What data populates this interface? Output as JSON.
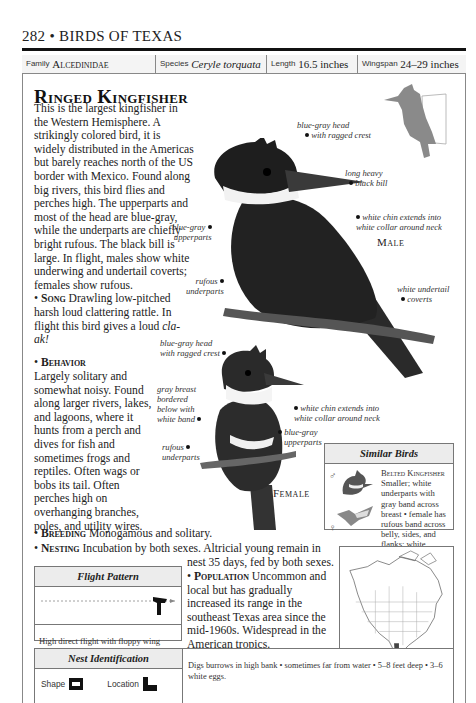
{
  "running_head": {
    "page_number": "282",
    "separator": "•",
    "book_title": "BIRDS OF TEXAS"
  },
  "info_bar": {
    "family": {
      "label": "Family",
      "value": "Alcedinidae"
    },
    "species": {
      "label": "Species",
      "value": "Ceryle torquata"
    },
    "length": {
      "label": "Length",
      "value": "16.5 inches"
    },
    "wingspan": {
      "label": "Wingspan",
      "value": "24–29 inches"
    }
  },
  "title": "Ringed Kingfisher",
  "description": "This is the largest kingfisher in the Western Hemisphere. A strikingly colored bird, it is widely distributed in the Americas but barely reaches north of the US border with Mexico. Found along big rivers, this bird flies and perches high. The upperparts and most of the head are blue-gray, while the underparts are chiefly bright rufous. The black bill is large. In flight, males show white underwing and undertail coverts; females show rufous.",
  "song": {
    "heading": "Song",
    "text": "Drawling low-pitched harsh loud clattering rattle. In flight this bird gives a loud",
    "call": "cla-ak!"
  },
  "behavior": {
    "heading": "Behavior",
    "text": "Largely solitary and somewhat noisy. Found along larger rivers, lakes, and lagoons, where it hunts from a perch and dives for fish and sometimes frogs and reptiles. Often wags or bobs its tail. Often perches high on overhanging branches, poles, and utility wires."
  },
  "breeding": {
    "heading": "Breeding",
    "text": "Monogamous and solitary."
  },
  "nesting": {
    "heading": "Nesting",
    "text_line1": "Incubation by both sexes. Altricial young remain in",
    "text_line2": "nest 35 days, fed by both sexes."
  },
  "population": {
    "heading": "Population",
    "text": "Uncommon and local but has gradually increased its range in the southeast Texas area since the mid-1960s. Widespread in the American tropics."
  },
  "male_illustration": {
    "label": "Male",
    "callouts": {
      "head": [
        "blue-gray head",
        "with ragged crest"
      ],
      "bill": [
        "long heavy",
        "black bill"
      ],
      "chin": [
        "white chin extends into",
        "white collar around neck"
      ],
      "upperparts": [
        "blue-gray",
        "upperparts"
      ],
      "underparts": [
        "rufous",
        "underparts"
      ],
      "undertail": [
        "white undertail",
        "coverts"
      ]
    }
  },
  "female_illustration": {
    "label": "Female",
    "callouts": {
      "head": [
        "blue-gray head",
        "with ragged crest"
      ],
      "breast": [
        "gray breast",
        "bordered",
        "below with",
        "white band"
      ],
      "chin": [
        "white chin extends into",
        "white collar around neck"
      ],
      "upperparts": [
        "blue-gray",
        "upperparts"
      ],
      "underparts": [
        "rufous",
        "underparts"
      ]
    }
  },
  "similar_birds": {
    "heading": "Similar Birds",
    "male_symbol": "♂",
    "female_symbol": "♀",
    "species_name": "Belted Kingfisher",
    "text": "Smaller; white underparts with gray band across breast • female has rufous band across belly, sides, and flanks; white undertail coverts."
  },
  "flight_pattern": {
    "heading": "Flight Pattern",
    "caption": "High direct flight with floppy wing beats."
  },
  "nest_identification": {
    "heading": "Nest Identification",
    "shape_label": "Shape",
    "location_label": "Location",
    "text": "Digs burrows in high bank • sometimes far from water • 5–8 feet deep • 3–6 white eggs."
  },
  "range_map": {
    "region": "North America",
    "highlight": "southern Texas"
  },
  "colors": {
    "text": "#1a1a1a",
    "rule": "#111111",
    "border": "#777777",
    "box_header_bg": "#ececec",
    "silhouette": "#8a8a8a"
  }
}
